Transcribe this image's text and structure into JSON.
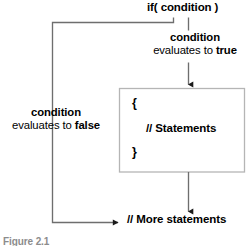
{
  "figure": {
    "caption": "Figure 2.1",
    "width": 251,
    "height": 246,
    "background_color": "#ffffff"
  },
  "colors": {
    "line": "#6e6e6e",
    "box_border": "#b5b5b5",
    "arrow": "#1a1a1a",
    "text": "#000000",
    "caption_text": "#8c8c8c"
  },
  "nodes": {
    "condition_header": {
      "text": "if( condition )",
      "bold": true
    },
    "true_branch_label": {
      "word_condition": "condition",
      "phrase_evaluates": "evaluates to ",
      "word_value": "true"
    },
    "false_branch_label": {
      "word_condition": "condition",
      "phrase_evaluates": "evaluates to ",
      "word_value": "false"
    },
    "statements_block": {
      "open_brace": "{",
      "body_comment": "// Statements",
      "close_brace": "}"
    },
    "exit_node": {
      "text": "// More statements"
    }
  },
  "edges": [
    {
      "name": "condition-to-true-branch",
      "from": "if( condition )",
      "to": "{ // Statements }",
      "label": "condition evaluates to true"
    },
    {
      "name": "condition-to-false-branch",
      "from": "if( condition )",
      "to": "// More statements",
      "label": "condition evaluates to false"
    },
    {
      "name": "statements-to-exit",
      "from": "{ // Statements }",
      "to": "// More statements",
      "label": ""
    }
  ]
}
